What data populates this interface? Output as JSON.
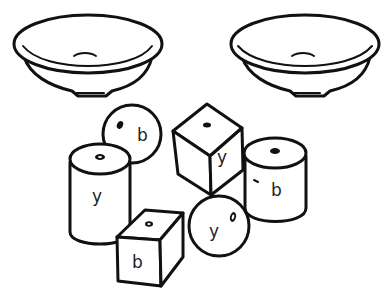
{
  "figure": {
    "bowls": [
      {
        "id": "left-bowl"
      },
      {
        "id": "right-bowl"
      }
    ],
    "beads": [
      {
        "shape": "sphere",
        "label": "b"
      },
      {
        "shape": "cylinder",
        "label": "y"
      },
      {
        "shape": "cube",
        "label": "y"
      },
      {
        "shape": "cylinder",
        "label": "b"
      },
      {
        "shape": "cube",
        "label": "b"
      },
      {
        "shape": "sphere",
        "label": "y"
      }
    ]
  }
}
